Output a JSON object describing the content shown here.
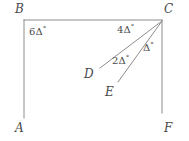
{
  "figure": {
    "background_color": "#ffffff",
    "stroke_color": "#8c8c8c",
    "label_color": "#4a4a4a",
    "stroke_width": 1,
    "vertices": [
      {
        "id": "B",
        "label": "B",
        "x": 24,
        "y": 20,
        "label_x": 15,
        "label_y": 3
      },
      {
        "id": "C",
        "label": "C",
        "x": 162,
        "y": 20,
        "label_x": 164,
        "label_y": 3
      },
      {
        "id": "A",
        "label": "A",
        "x": 24,
        "y": 118,
        "label_x": 15,
        "label_y": 122
      },
      {
        "id": "F",
        "label": "F",
        "x": 162,
        "y": 113,
        "label_x": 164,
        "label_y": 122
      },
      {
        "id": "D",
        "label": "D",
        "x": 100,
        "y": 68,
        "label_x": 84,
        "label_y": 68
      },
      {
        "id": "E",
        "label": "E",
        "x": 118,
        "y": 82,
        "label_x": 105,
        "label_y": 86
      }
    ],
    "segments": [
      {
        "id": "AB",
        "from": "A",
        "to": "B",
        "x1": 24,
        "y1": 118,
        "x2": 24,
        "y2": 20
      },
      {
        "id": "BC",
        "from": "B",
        "to": "C",
        "x1": 24,
        "y1": 20,
        "x2": 162,
        "y2": 20
      },
      {
        "id": "CF",
        "from": "C",
        "to": "F",
        "x1": 162,
        "y1": 20,
        "x2": 162,
        "y2": 113
      },
      {
        "id": "CD",
        "from": "C",
        "to": "D",
        "x1": 162,
        "y1": 21,
        "x2": 100,
        "y2": 68
      },
      {
        "id": "CE",
        "from": "C",
        "to": "E",
        "x1": 162,
        "y1": 21,
        "x2": 118,
        "y2": 82
      }
    ],
    "angle_labels": [
      {
        "id": "angle-B",
        "coefficient": "6",
        "symbol": "Δ",
        "degree": "°",
        "text": "6Δ°",
        "at_vertex": "B",
        "x": 29,
        "y": 26
      },
      {
        "id": "angle-BCD",
        "coefficient": "4",
        "symbol": "Δ",
        "degree": "°",
        "text": "4Δ°",
        "at_vertex": "C",
        "x": 117,
        "y": 24
      },
      {
        "id": "angle-DCE",
        "coefficient": "2",
        "symbol": "Δ",
        "degree": "°",
        "text": "2Δ°",
        "at_vertex": "C",
        "x": 112,
        "y": 55
      },
      {
        "id": "angle-ECF",
        "coefficient": "",
        "symbol": "Δ",
        "degree": "°",
        "text": "Δ°",
        "at_vertex": "C",
        "x": 143,
        "y": 42
      }
    ]
  }
}
